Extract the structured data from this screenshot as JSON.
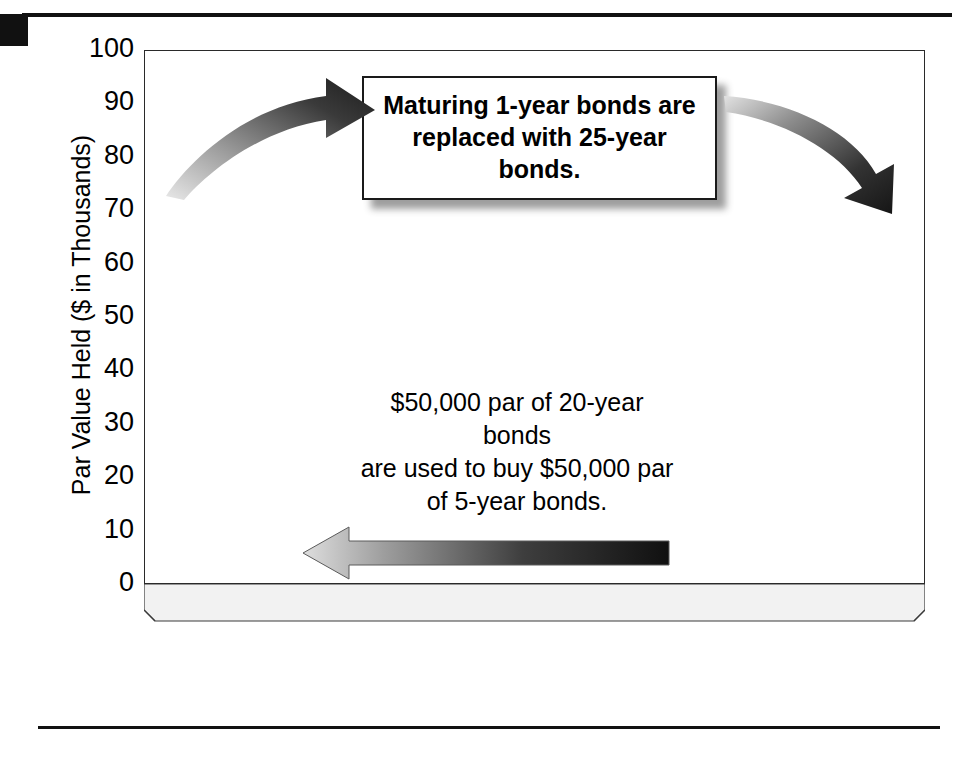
{
  "figure": {
    "corner_tab": "black-tab",
    "top_rule": "rule",
    "bottom_rule": "rule"
  },
  "chart_data": {
    "type": "bar",
    "title": "",
    "subtitle": "",
    "xlabel": "Years until Maturity",
    "ylabel": "Par Value Held ($ in Thousands)",
    "xlim": [
      0,
      25
    ],
    "ylim": [
      0,
      100
    ],
    "xticks": [
      0,
      5,
      10,
      15,
      20,
      25
    ],
    "yticks": [
      0,
      10,
      20,
      30,
      40,
      50,
      60,
      70,
      80,
      90,
      100
    ],
    "grid": true,
    "legend": "none",
    "style": "3d-column",
    "categories": [
      0,
      1,
      2,
      3,
      4,
      5,
      6,
      7,
      8,
      9,
      10,
      11,
      12,
      13,
      14,
      15,
      16,
      17,
      18,
      19,
      20,
      21,
      22,
      23,
      24,
      25
    ],
    "values": [
      65,
      65,
      65,
      65,
      65,
      65,
      15,
      15,
      15,
      15,
      15,
      15,
      15,
      15,
      15,
      15,
      15,
      15,
      15,
      15,
      65,
      65,
      65,
      65,
      65,
      65
    ],
    "highlight_index": 25,
    "highlight_color": "#151515",
    "bar_color": "#9b9b9b",
    "annotations": [
      {
        "id": "callout-top",
        "text": "Maturing 1-year bonds are replaced with 25-year bonds.",
        "line1": "Maturing 1-year bonds are",
        "line2": "replaced with 25-year bonds.",
        "boxed": true,
        "bold": true
      },
      {
        "id": "callout-mid",
        "text": "$50,000 par of 20-year bonds are used to buy $50,000 par of 5-year bonds.",
        "line1": "$50,000 par of 20-year bonds",
        "line2": "are used to buy $50,000 par",
        "line3": "of 5-year bonds.",
        "boxed": false,
        "bold": false
      }
    ],
    "arrows": [
      {
        "id": "arrow-left-curved",
        "shape": "curved",
        "direction": "up-right",
        "note": "points from short bars up to callout"
      },
      {
        "id": "arrow-right-curved",
        "shape": "curved",
        "direction": "down-right",
        "note": "points from callout to 25-year bars"
      },
      {
        "id": "arrow-straight-left",
        "shape": "straight",
        "direction": "left",
        "note": "20-year bonds move to 5-year bonds"
      }
    ]
  },
  "ticks": {
    "y": [
      "100",
      "90",
      "80",
      "70",
      "60",
      "50",
      "40",
      "30",
      "20",
      "10",
      "0"
    ],
    "x": [
      "0",
      "5",
      "10",
      "15",
      "20",
      "25"
    ]
  },
  "axes": {
    "x_title": "Years until Maturity",
    "y_title": "Par Value Held ($ in Thousands)"
  },
  "colors": {
    "bar": "#9b9b9b",
    "bar_side": "#5e5e5e",
    "bar_top": "#cfcfcf",
    "bar_highlight": "#151515",
    "grid": "#4a4a4a",
    "frame": "#2a2a2a",
    "rule": "#111111"
  }
}
